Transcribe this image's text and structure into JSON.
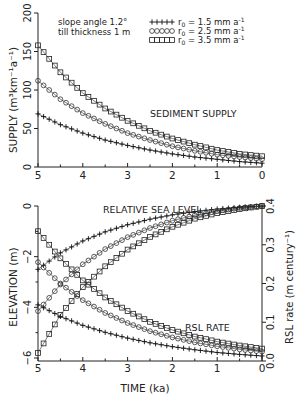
{
  "chart_data": [
    {
      "type": "line",
      "title": "SEDIMENT SUPPLY",
      "annotations": [
        "slope angle 1.2°",
        "till thickness 1 m"
      ],
      "xlabel": "",
      "ylabel": "SUPPLY (m³km⁻¹a⁻¹)",
      "xlim": [
        5,
        0
      ],
      "ylim": [
        0,
        200
      ],
      "xticks": [
        5,
        4,
        3,
        2,
        1,
        0
      ],
      "yticks": [
        0,
        50,
        100,
        150,
        200
      ],
      "grid": false,
      "legend_position": "upper right",
      "x": [
        5.0,
        4.5,
        4.0,
        3.5,
        3.0,
        2.5,
        2.0,
        1.5,
        1.0,
        0.5,
        0.0
      ],
      "series": [
        {
          "name": "r0 = 1.5 mm a⁻¹",
          "marker": "plus",
          "values": [
            69,
            55,
            44,
            35,
            28,
            22,
            17,
            13,
            10,
            7,
            5
          ]
        },
        {
          "name": "r0 = 2.5 mm a⁻¹",
          "marker": "circle",
          "values": [
            112,
            88,
            70,
            56,
            44,
            35,
            27,
            21,
            16,
            13,
            10
          ]
        },
        {
          "name": "r0 = 3.5 mm a⁻¹",
          "marker": "square",
          "values": [
            158,
            123,
            96,
            76,
            60,
            47,
            37,
            29,
            22,
            17,
            14
          ]
        }
      ]
    },
    {
      "type": "line",
      "title": "RELATIVE SEA LEVEL / RSL RATE",
      "annotations": [
        "RELATIVE SEA LEVEL",
        "RSL RATE"
      ],
      "xlabel": "TIME (ka)",
      "ylabel": "ELEVATION (m)",
      "ylabel_right": "RSL rate (m century⁻¹)",
      "xlim": [
        5,
        0
      ],
      "ylim": [
        -6,
        0
      ],
      "ylim_right": [
        0.0,
        0.4
      ],
      "xticks": [
        5,
        4,
        3,
        2,
        1,
        0
      ],
      "yticks": [
        0,
        -2,
        -4,
        -6
      ],
      "yticks_right": [
        0.0,
        0.1,
        0.2,
        0.3,
        0.4
      ],
      "grid": false,
      "x": [
        5.0,
        4.5,
        4.0,
        3.5,
        3.0,
        2.5,
        2.0,
        1.5,
        1.0,
        0.5,
        0.0
      ],
      "series": [
        {
          "name": "Elevation r0 = 1.5 mm a⁻¹",
          "axis": "left",
          "marker": "plus",
          "values": [
            -2.5,
            -1.85,
            -1.38,
            -1.02,
            -0.74,
            -0.52,
            -0.35,
            -0.22,
            -0.12,
            -0.05,
            0.0
          ]
        },
        {
          "name": "Elevation r0 = 2.5 mm a⁻¹",
          "axis": "left",
          "marker": "circle",
          "values": [
            -4.15,
            -3.1,
            -2.3,
            -1.7,
            -1.23,
            -0.87,
            -0.58,
            -0.36,
            -0.2,
            -0.08,
            0.0
          ]
        },
        {
          "name": "Elevation r0 = 3.5 mm a⁻¹",
          "axis": "left",
          "marker": "square",
          "values": [
            -5.8,
            -4.3,
            -3.2,
            -2.38,
            -1.72,
            -1.22,
            -0.82,
            -0.5,
            -0.28,
            -0.12,
            0.0
          ]
        },
        {
          "name": "RSL rate r0 = 1.5 mm a⁻¹",
          "axis": "right",
          "marker": "plus",
          "values": [
            0.145,
            0.115,
            0.092,
            0.074,
            0.059,
            0.047,
            0.037,
            0.029,
            0.022,
            0.017,
            0.013
          ]
        },
        {
          "name": "RSL rate r0 = 2.5 mm a⁻¹",
          "axis": "right",
          "marker": "circle",
          "values": [
            0.255,
            0.2,
            0.157,
            0.124,
            0.098,
            0.077,
            0.061,
            0.048,
            0.038,
            0.03,
            0.024
          ]
        },
        {
          "name": "RSL rate r0 = 3.5 mm a⁻¹",
          "axis": "right",
          "marker": "square",
          "values": [
            0.335,
            0.265,
            0.208,
            0.164,
            0.129,
            0.101,
            0.08,
            0.063,
            0.05,
            0.04,
            0.032
          ]
        }
      ]
    }
  ],
  "labels": {
    "annotation_line1": "slope angle 1.2°",
    "annotation_line2": "till thickness 1 m",
    "legend": [
      {
        "marker": "plus",
        "r": "r",
        "sub": "0",
        "text": " =  1.5  mm a",
        "sup": "-1"
      },
      {
        "marker": "circle",
        "r": "r",
        "sub": "0",
        "text": " =  2.5  mm a",
        "sup": "-1"
      },
      {
        "marker": "square",
        "r": "r",
        "sub": "0",
        "text": " =  3.5  mm a",
        "sup": "-1"
      }
    ],
    "upper_title": "SEDIMENT SUPPLY",
    "upper_ylabel": "SUPPLY (m³km⁻¹a⁻¹)",
    "lower_title": "RELATIVE SEA LEVEL",
    "lower_rate_title": "RSL RATE",
    "lower_ylabel": "ELEVATION (m)",
    "lower_ylabel_right": "RSL rate (m century⁻¹)",
    "xlabel": "TIME (ka)"
  }
}
